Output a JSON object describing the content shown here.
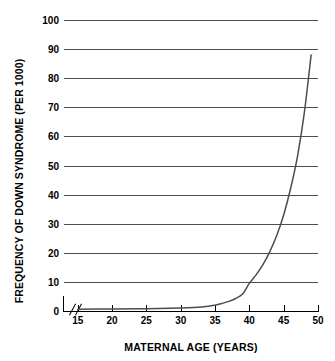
{
  "chart_data": {
    "type": "line",
    "title": "",
    "xlabel": "MATERNAL AGE (YEARS)",
    "ylabel": "FREQUENCY OF DOWN SYNDROME (PER 1000)",
    "xlim": [
      13,
      50
    ],
    "ylim": [
      0,
      100
    ],
    "xticks": [
      15,
      20,
      25,
      30,
      35,
      40,
      45,
      50
    ],
    "xtick_labels": [
      "15",
      "20",
      "25",
      "30",
      "35",
      "40",
      "45",
      "50"
    ],
    "yticks": [
      0,
      10,
      20,
      30,
      40,
      50,
      60,
      70,
      80,
      90,
      100
    ],
    "ytick_labels": [
      "0",
      "10",
      "20",
      "30",
      "40",
      "50",
      "60",
      "70",
      "80",
      "90",
      "100"
    ],
    "grid": "horizontal",
    "legend": "none",
    "axis_break": "x-axis break between origin and 15",
    "series": [
      {
        "name": "Frequency of Down syndrome",
        "x": [
          15,
          20,
          25,
          30,
          32,
          34,
          35,
          36,
          37,
          38,
          39,
          40,
          41,
          42,
          43,
          44,
          45,
          46,
          47,
          48,
          49
        ],
        "values": [
          0.6,
          0.7,
          0.8,
          1.0,
          1.2,
          1.6,
          2.0,
          2.6,
          3.3,
          4.3,
          5.8,
          9.5,
          12.5,
          16.0,
          20.5,
          26.0,
          33.0,
          42.0,
          53.0,
          68.0,
          88.0
        ]
      }
    ],
    "colors": {
      "curve": "#4d4d4d",
      "gridline": "#4d4d4d",
      "axis": "#000000",
      "text": "#000000",
      "background": "#ffffff"
    }
  },
  "axes": {
    "y_title": "FREQUENCY OF DOWN SYNDROME (PER 1000)",
    "x_title": "MATERNAL AGE (YEARS)"
  },
  "title_artifact": "·"
}
